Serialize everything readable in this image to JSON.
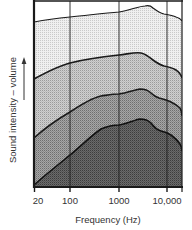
{
  "chart_data": {
    "type": "area",
    "title": "",
    "xlabel": "Frequency (Hz)",
    "ylabel": "Sound intensity – volume",
    "xscale": "log",
    "x_ticks": [
      20,
      100,
      1000,
      10000
    ],
    "x_tick_labels": [
      "20",
      "100",
      "1000",
      "10,000"
    ],
    "xlim": [
      20,
      20000
    ],
    "ylim": [
      0,
      100
    ],
    "y_ticks": [],
    "grid": "vertical lines at 100, 1000, 10000 Hz",
    "legend": null,
    "annotations": [
      "upward arrow beside y-axis label"
    ],
    "x": [
      20,
      100,
      300,
      1000,
      3000,
      5000,
      10000,
      20000
    ],
    "series": [
      {
        "name": "band-1 (top, lightest)",
        "fill": "#ececec",
        "values": [
          88,
          91,
          93,
          94,
          98,
          95,
          91,
          88
        ]
      },
      {
        "name": "band-2",
        "fill": "#c8c8c8",
        "values": [
          58,
          67,
          70,
          71,
          72,
          66,
          63,
          59
        ]
      },
      {
        "name": "band-3",
        "fill": "#9a9a9a",
        "values": [
          26,
          40,
          49,
          50,
          52,
          49,
          45,
          39
        ]
      },
      {
        "name": "band-4 (bottom, darkest)",
        "fill": "#5e5e5e",
        "values": [
          1,
          17,
          32,
          34,
          37,
          33,
          28,
          20
        ]
      }
    ]
  },
  "axis": {
    "ylabel": "Sound intensity – volume",
    "xlabel": "Frequency (Hz)",
    "ticks": [
      {
        "label": "20",
        "x": 36
      },
      {
        "label": "100",
        "x": 70
      },
      {
        "label": "1000",
        "x": 119
      },
      {
        "label": "10,000",
        "x": 167
      }
    ]
  },
  "geometry": {
    "curve1": "M34,22 C50,19 60,18 70,17 C90,15 105,13 119,12 C130,10 140,6 145,6 C149,5 151,6 153,8 C157,11 160,13 164,14 C170,15 174,16 176,17 C179,18 181,19 182,21",
    "curve2": "M34,79 C45,73 58,66 70,63 C85,59 100,57 119,55 C128,54 135,52 141,53 C146,54 149,57 153,60 C157,63 160,65 164,66 C169,67 173,68 176,70 C179,72 181,74 182,78",
    "curve3": "M34,138 C45,128 58,119 70,112 C82,104 92,98 101,96 C108,95 113,94 119,94 C127,93 134,90 140,89 C145,89 148,90 151,93 C154,96 156,97 159,98 C163,99 167,100 171,102 C175,104 178,106 180,108 C181,110 182,112 182,116",
    "curve4": "M34,185 C45,175 58,165 70,155 C82,145 92,135 101,129 C108,126 113,125 119,125 C127,124 134,120 140,119 C145,119 148,120 151,123 C154,127 157,130 161,131 C165,132 168,133 171,135 C175,138 178,141 180,144 C181,146 182,148 182,151"
  }
}
